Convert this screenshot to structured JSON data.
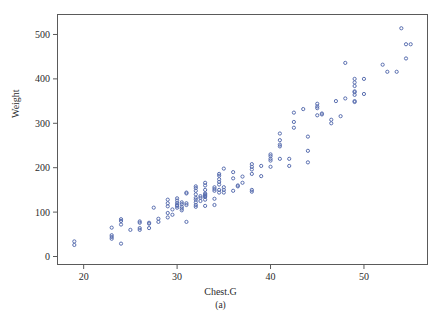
{
  "figure": {
    "subcaption": "(a)",
    "bottom_caption_partial": "",
    "background_color": "#ffffff",
    "frame_color": "#5a5a5a",
    "marker_color": "#5a6fb0"
  },
  "chart_data": {
    "type": "scatter",
    "title": "",
    "xlabel": "Chest.G",
    "ylabel": "Weight",
    "xlim": [
      17.2,
      56.8
    ],
    "ylim": [
      -18,
      545
    ],
    "xticks": [
      20,
      30,
      40,
      50
    ],
    "yticks": [
      0,
      100,
      200,
      300,
      400,
      500
    ],
    "grid": false,
    "legend": null,
    "marker": "open-circle",
    "marker_size": 3.2,
    "series": [
      {
        "name": "bears",
        "color": "#5a6fb0",
        "points": [
          [
            19.0,
            26
          ],
          [
            19.0,
            34
          ],
          [
            23.0,
            40
          ],
          [
            23.0,
            44
          ],
          [
            23.0,
            48
          ],
          [
            23.0,
            65
          ],
          [
            24.0,
            29
          ],
          [
            24.0,
            72
          ],
          [
            24.0,
            80
          ],
          [
            24.0,
            84
          ],
          [
            25.0,
            60
          ],
          [
            26.0,
            60
          ],
          [
            26.0,
            64
          ],
          [
            26.0,
            76
          ],
          [
            26.0,
            79
          ],
          [
            27.0,
            64
          ],
          [
            27.0,
            74
          ],
          [
            27.0,
            76
          ],
          [
            27.5,
            110
          ],
          [
            28.0,
            78
          ],
          [
            28.0,
            85
          ],
          [
            29.0,
            88
          ],
          [
            29.0,
            98
          ],
          [
            29.0,
            113
          ],
          [
            29.0,
            120
          ],
          [
            29.0,
            128
          ],
          [
            29.5,
            94
          ],
          [
            29.5,
            106
          ],
          [
            30.0,
            110
          ],
          [
            30.0,
            114
          ],
          [
            30.0,
            116
          ],
          [
            30.0,
            120
          ],
          [
            30.0,
            126
          ],
          [
            30.0,
            131
          ],
          [
            30.5,
            104
          ],
          [
            30.5,
            108
          ],
          [
            30.5,
            112
          ],
          [
            30.5,
            118
          ],
          [
            30.5,
            122
          ],
          [
            31.0,
            78
          ],
          [
            31.0,
            116
          ],
          [
            31.0,
            120
          ],
          [
            31.0,
            142
          ],
          [
            31.0,
            144
          ],
          [
            32.0,
            112
          ],
          [
            32.0,
            116
          ],
          [
            32.0,
            122
          ],
          [
            32.0,
            128
          ],
          [
            32.0,
            132
          ],
          [
            32.0,
            140
          ],
          [
            32.0,
            148
          ],
          [
            32.0,
            154
          ],
          [
            32.0,
            158
          ],
          [
            32.5,
            125
          ],
          [
            32.5,
            132
          ],
          [
            32.5,
            136
          ],
          [
            33.0,
            114
          ],
          [
            33.0,
            128
          ],
          [
            33.0,
            134
          ],
          [
            33.0,
            136
          ],
          [
            33.0,
            138
          ],
          [
            33.0,
            140
          ],
          [
            33.0,
            142
          ],
          [
            33.0,
            150
          ],
          [
            33.0,
            160
          ],
          [
            33.0,
            166
          ],
          [
            34.0,
            116
          ],
          [
            34.0,
            130
          ],
          [
            34.0,
            148
          ],
          [
            34.0,
            152
          ],
          [
            34.0,
            156
          ],
          [
            34.5,
            144
          ],
          [
            34.5,
            150
          ],
          [
            34.5,
            162
          ],
          [
            34.5,
            168
          ],
          [
            34.5,
            174
          ],
          [
            34.5,
            182
          ],
          [
            34.5,
            186
          ],
          [
            35.0,
            144
          ],
          [
            35.0,
            150
          ],
          [
            35.0,
            156
          ],
          [
            35.0,
            198
          ],
          [
            36.0,
            148
          ],
          [
            36.0,
            176
          ],
          [
            36.0,
            190
          ],
          [
            36.5,
            158
          ],
          [
            36.5,
            160
          ],
          [
            37.0,
            166
          ],
          [
            37.0,
            180
          ],
          [
            38.0,
            146
          ],
          [
            38.0,
            150
          ],
          [
            38.0,
            186
          ],
          [
            38.0,
            196
          ],
          [
            38.0,
            202
          ],
          [
            38.0,
            208
          ],
          [
            39.0,
            181
          ],
          [
            39.0,
            204
          ],
          [
            40.0,
            202
          ],
          [
            40.0,
            216
          ],
          [
            40.0,
            220
          ],
          [
            40.0,
            226
          ],
          [
            40.0,
            230
          ],
          [
            41.0,
            220
          ],
          [
            41.0,
            248
          ],
          [
            41.0,
            252
          ],
          [
            41.0,
            262
          ],
          [
            41.0,
            277
          ],
          [
            42.0,
            204
          ],
          [
            42.0,
            220
          ],
          [
            42.5,
            290
          ],
          [
            42.5,
            303
          ],
          [
            42.5,
            324
          ],
          [
            43.5,
            332
          ],
          [
            44.0,
            212
          ],
          [
            44.0,
            238
          ],
          [
            44.0,
            270
          ],
          [
            45.0,
            318
          ],
          [
            45.0,
            334
          ],
          [
            45.0,
            338
          ],
          [
            45.0,
            344
          ],
          [
            45.5,
            320
          ],
          [
            45.5,
            322
          ],
          [
            46.5,
            300
          ],
          [
            46.5,
            308
          ],
          [
            47.0,
            350
          ],
          [
            47.5,
            316
          ],
          [
            48.0,
            356
          ],
          [
            48.0,
            436
          ],
          [
            49.0,
            348
          ],
          [
            49.0,
            350
          ],
          [
            49.0,
            364
          ],
          [
            49.0,
            370
          ],
          [
            49.0,
            372
          ],
          [
            49.0,
            384
          ],
          [
            49.0,
            392
          ],
          [
            49.0,
            400
          ],
          [
            50.0,
            366
          ],
          [
            50.0,
            400
          ],
          [
            52.0,
            432
          ],
          [
            52.5,
            416
          ],
          [
            53.5,
            416
          ],
          [
            54.0,
            514
          ],
          [
            54.5,
            478
          ],
          [
            54.5,
            446
          ],
          [
            55.0,
            478
          ]
        ]
      }
    ]
  }
}
